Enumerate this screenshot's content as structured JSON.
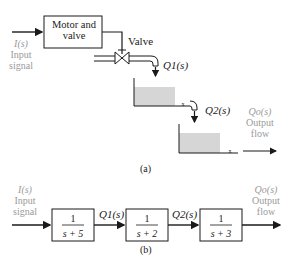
{
  "diagram_a": {
    "caption": "(a)",
    "motor_box": "Motor and valve",
    "motor_line1": "Motor and",
    "motor_line2": "valve",
    "valve_label": "Valve",
    "input": {
      "symbol": "I(s)",
      "line1": "Input",
      "line2": "signal"
    },
    "q1": "Q1(s)",
    "q2": "Q2(s)",
    "output": {
      "symbol": "Qo(s)",
      "line1": "Output",
      "line2": "flow"
    }
  },
  "diagram_b": {
    "caption": "(b)",
    "input": {
      "symbol": "I(s)",
      "line1": "Input",
      "line2": "signal"
    },
    "blocks": [
      {
        "num": "1",
        "den": "s + 5"
      },
      {
        "num": "1",
        "den": "s + 2"
      },
      {
        "num": "1",
        "den": "s + 3"
      }
    ],
    "q1": "Q1(s)",
    "q2": "Q2(s)",
    "output": {
      "symbol": "Qo(s)",
      "line1": "Output",
      "line2": "flow"
    }
  },
  "colors": {
    "line": "#1a1a1a",
    "muted_text": "#9a9a9a",
    "water": "#d6d6d6"
  }
}
